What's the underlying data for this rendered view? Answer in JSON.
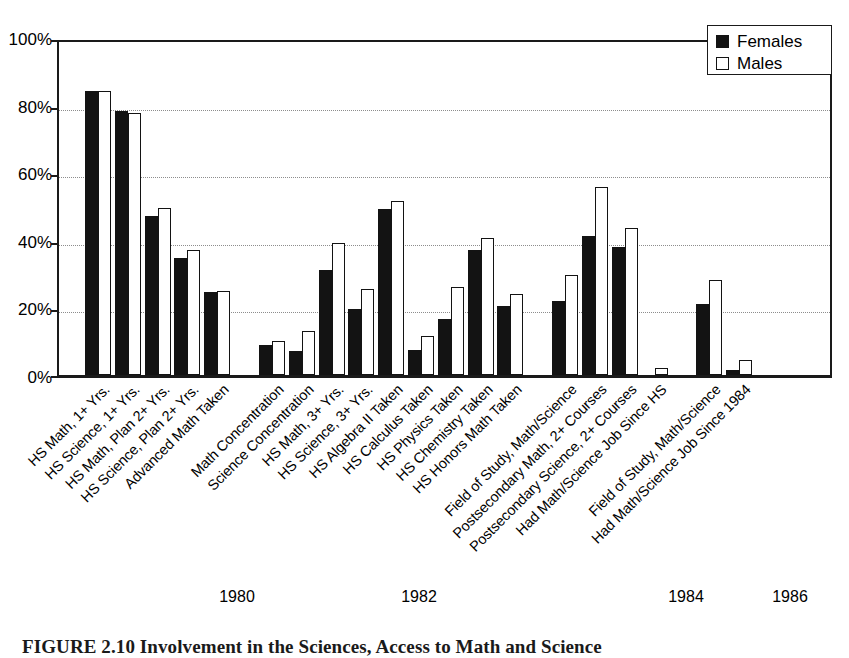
{
  "figure": {
    "caption": "FIGURE 2.10   Involvement in the Sciences, Access to Math and Science",
    "legend": {
      "position": "top-right",
      "entries": [
        {
          "label": "Females",
          "swatch": "filled-black-square",
          "color": "#131313"
        },
        {
          "label": "Males",
          "swatch": "open-white-square",
          "color": "#ffffff"
        }
      ]
    },
    "year_labels": [
      {
        "text": "1980",
        "x": 237
      },
      {
        "text": "1982",
        "x": 419
      },
      {
        "text": "1984",
        "x": 686
      },
      {
        "text": "1986",
        "x": 790
      }
    ]
  },
  "chart_data": {
    "type": "bar",
    "title": "",
    "xlabel": "",
    "ylabel": "",
    "ylim": [
      0,
      100
    ],
    "ytick_labels": [
      "0%",
      "20%",
      "40%",
      "60%",
      "80%",
      "100%"
    ],
    "ytick_values": [
      0,
      20,
      40,
      60,
      80,
      100
    ],
    "grid": "horizontal-dotted",
    "units": "percent",
    "legend_position": "upper right",
    "groups": [
      {
        "year": "1980",
        "categories": [
          "HS Math, 1+ Yrs.",
          "HS Science, 1+ Yrs.",
          "HS Math, Plan 2+ Yrs.",
          "HS Science, Plan 2+ Yrs.",
          "Advanced Math Taken"
        ]
      },
      {
        "year": "1982",
        "categories": [
          "Math Concentration",
          "Science Concentration",
          "HS Math, 3+ Yrs.",
          "HS Science, 3+ Yrs.",
          "HS Algebra II Taken",
          "HS Calculus Taken",
          "HS Physics Taken",
          "HS Chemistry Taken",
          "HS Honors Math Taken"
        ]
      },
      {
        "year": "1984",
        "categories": [
          "Field of Study, Math/Science",
          "Postsecondary Math, 2+ Courses",
          "Postsecondary Science, 2+ Courses",
          "Had Math/Science Job Since HS"
        ]
      },
      {
        "year": "1986",
        "categories": [
          "Field of Study, Math/Science",
          "Had Math/Science Job Since 1984"
        ]
      }
    ],
    "categories": [
      "HS Math, 1+ Yrs.",
      "HS Science, 1+ Yrs.",
      "HS Math, Plan 2+ Yrs.",
      "HS Science, Plan 2+ Yrs.",
      "Advanced Math Taken",
      "Math Concentration",
      "Science Concentration",
      "HS Math, 3+ Yrs.",
      "HS Science, 3+ Yrs.",
      "HS Algebra II Taken",
      "HS Calculus Taken",
      "HS Physics Taken",
      "HS Chemistry Taken",
      "HS Honors Math Taken",
      "Field of Study, Math/Science",
      "Postsecondary Math, 2+ Courses",
      "Postsecondary Science, 2+ Courses",
      "Had Math/Science Job Since HS",
      "Field of Study, Math/Science",
      "Had Math/Science Job Since 1984"
    ],
    "series": [
      {
        "name": "Females",
        "color": "#131313",
        "values": [
          84,
          78,
          47,
          34.5,
          24.5,
          9,
          7,
          31,
          19.5,
          49,
          7.5,
          16.5,
          37,
          20.5,
          22,
          41,
          38,
          0,
          21,
          1.5
        ]
      },
      {
        "name": "Males",
        "color": "#ffffff",
        "values": [
          84,
          77.5,
          49.5,
          37,
          25,
          10,
          13,
          39,
          25.5,
          51.5,
          11.5,
          26,
          40.5,
          24,
          29.5,
          55.5,
          43.5,
          2,
          28,
          4.5
        ]
      }
    ],
    "bar_layout": {
      "plot_left_px": 57,
      "plot_top_px": 40,
      "plot_width_px": 775,
      "plot_height_px": 338,
      "bar_width_px": 13,
      "group_gaps_after_index": [
        4,
        13,
        17
      ]
    }
  }
}
